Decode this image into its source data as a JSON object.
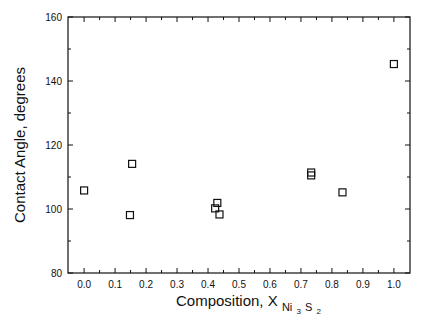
{
  "chart_data": {
    "type": "scatter",
    "title": "",
    "xlabel": "Composition, X",
    "xlabel_subscript": {
      "main": "Ni",
      "sub1": "3",
      "mid": "S",
      "sub2": "2"
    },
    "ylabel": "Contact Angle, degrees",
    "xlim": [
      -0.052,
      1.052
    ],
    "ylim": [
      80,
      160
    ],
    "x_ticks": [
      0.0,
      0.1,
      0.2,
      0.3,
      0.4,
      0.5,
      0.6,
      0.7,
      0.8,
      0.9,
      1.0
    ],
    "x_tick_labels": [
      "0.0",
      "0.1",
      "0.2",
      "0.3",
      "0.4",
      "0.5",
      "0.6",
      "0.7",
      "0.8",
      "0.9",
      "1.0"
    ],
    "x_minor_ticks": [
      0.05,
      0.15,
      0.25,
      0.35,
      0.45,
      0.55,
      0.65,
      0.75,
      0.85,
      0.95
    ],
    "y_ticks": [
      80,
      100,
      120,
      140,
      160
    ],
    "y_tick_labels": [
      "80",
      "100",
      "120",
      "140",
      "160"
    ],
    "y_minor_ticks": [
      90,
      110,
      130,
      150
    ],
    "grid": false,
    "legend": null,
    "marker": "open-square",
    "series": [
      {
        "name": "Contact angle",
        "x": [
          0.0,
          0.148,
          0.155,
          0.423,
          0.43,
          0.437,
          0.733,
          0.733,
          0.834,
          1.0
        ],
        "y": [
          105.8,
          98.1,
          114.1,
          100.2,
          101.9,
          98.3,
          110.5,
          111.4,
          105.2,
          145.3
        ]
      }
    ]
  }
}
